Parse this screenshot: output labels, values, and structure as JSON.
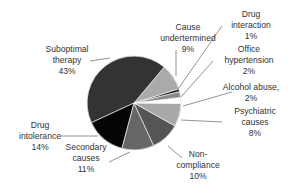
{
  "chart_data": {
    "type": "pie",
    "title": "",
    "categories": [
      "Drug interaction",
      "Cause undertermined",
      "Suboptimal therapy",
      "Drug intolerance",
      "Secondary causes",
      "Non-compliance",
      "Psychiatric causes",
      "Alcohol abuse,",
      "Office hypertension"
    ],
    "values": [
      1,
      9,
      43,
      14,
      11,
      10,
      8,
      2,
      2
    ],
    "colors": [
      "#111111",
      "#aaaaaa",
      "#333333",
      "#050505",
      "#666666",
      "#555555",
      "#a8a8a8",
      "#ffffff",
      "#8a8a8a"
    ],
    "labels": [
      {
        "lines": [
          "Drug",
          "interaction",
          "1%"
        ]
      },
      {
        "lines": [
          "Cause",
          "undertermined",
          "9%"
        ]
      },
      {
        "lines": [
          "Suboptimal",
          "therapy",
          "43%"
        ]
      },
      {
        "lines": [
          "Drug",
          "intolerance",
          "14%"
        ]
      },
      {
        "lines": [
          "Secondary",
          "causes",
          "11%"
        ]
      },
      {
        "lines": [
          "Non-",
          "compliance",
          "10%"
        ]
      },
      {
        "lines": [
          "Psychiatric",
          "causes",
          "8%"
        ]
      },
      {
        "lines": [
          "Alcohol abuse,",
          "2%"
        ]
      },
      {
        "lines": [
          "Office",
          "hypertension",
          "2%"
        ]
      }
    ],
    "unit": "%",
    "legend": "none (leader-line labels)"
  }
}
